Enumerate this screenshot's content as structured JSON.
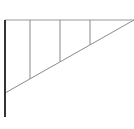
{
  "diagram": {
    "type": "cantilever-bracket",
    "colors": {
      "post": "#333333",
      "beam": "#9a9a9a",
      "strut": "#8a8a8a",
      "brace": "#8a8a8a",
      "background": "#ffffff"
    },
    "post": {
      "x": 5,
      "y1": 20,
      "y2": 117
    },
    "top_beam": {
      "x1": 5,
      "x2": 134,
      "y": 20
    },
    "diagonal_brace": {
      "x1": 5,
      "y1": 93,
      "x2": 134,
      "y2": 20
    },
    "struts": [
      {
        "x": 30,
        "y_top": 20,
        "y_bottom": 79
      },
      {
        "x": 60,
        "y_top": 20,
        "y_bottom": 62
      },
      {
        "x": 90,
        "y_top": 20,
        "y_bottom": 45
      }
    ]
  }
}
